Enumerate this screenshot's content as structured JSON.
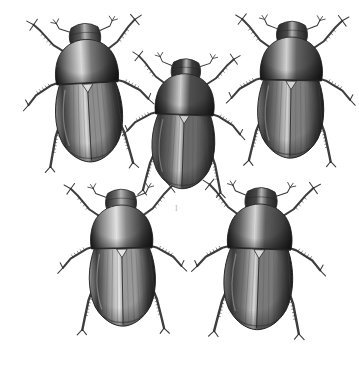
{
  "plate": {
    "title": "Engraved natural-history plate of five scarab beetles",
    "background_color": "#ffffff",
    "width": 359,
    "height": 380,
    "medium": "monochrome steel engraving / stipple halftone",
    "subject": "five dorsal-view scarabaeid beetles arranged in two rows (three above, two below)",
    "figure_mark": "I",
    "figure_mark_color": "#b9b9b9",
    "palette": {
      "ink_darkest": "#242424",
      "ink_dark": "#3d3d3d",
      "body_mid": "#6f6f6f",
      "body_light": "#a8a8a8",
      "highlight": "#e2e2e2",
      "paper": "#ffffff",
      "leg_ink": "#2e2e2e",
      "stria_ink": "#555555"
    },
    "specimens": [
      {
        "id": "beetle-top-left",
        "label": "Top-left specimen",
        "x": 18,
        "y": 14,
        "width": 140,
        "height": 160,
        "rotation": -3,
        "tone": "medium-light",
        "body_fill": "#8e8e8e",
        "pronotum_fill": "#7a7a7a",
        "head_fill": "#5e5e5e",
        "elytra_highlight": "#dcdcdc",
        "stria_count": 13
      },
      {
        "id": "beetle-top-center",
        "label": "Top-center specimen",
        "x": 120,
        "y": 50,
        "width": 128,
        "height": 150,
        "rotation": 2,
        "tone": "dark",
        "body_fill": "#6a6a6a",
        "pronotum_fill": "#4f4f4f",
        "head_fill": "#3c3c3c",
        "elytra_highlight": "#cfcfcf",
        "stria_count": 13
      },
      {
        "id": "beetle-top-right",
        "label": "Top-right specimen",
        "x": 225,
        "y": 12,
        "width": 132,
        "height": 158,
        "rotation": 1,
        "tone": "medium",
        "body_fill": "#7f7f7f",
        "pronotum_fill": "#636363",
        "head_fill": "#4a4a4a",
        "elytra_highlight": "#d4d4d4",
        "stria_count": 13
      },
      {
        "id": "beetle-bottom-left",
        "label": "Bottom-left specimen",
        "x": 56,
        "y": 180,
        "width": 132,
        "height": 158,
        "rotation": -1,
        "tone": "light",
        "body_fill": "#9a9a9a",
        "pronotum_fill": "#868686",
        "head_fill": "#6b6b6b",
        "elytra_highlight": "#e4e4e4",
        "stria_count": 13
      },
      {
        "id": "beetle-bottom-right",
        "label": "Bottom-right specimen",
        "x": 188,
        "y": 178,
        "width": 142,
        "height": 164,
        "rotation": 2,
        "tone": "medium-dark",
        "body_fill": "#7a7a7a",
        "pronotum_fill": "#5e5e5e",
        "head_fill": "#474747",
        "elytra_highlight": "#d8d8d8",
        "stria_count": 13
      }
    ]
  }
}
